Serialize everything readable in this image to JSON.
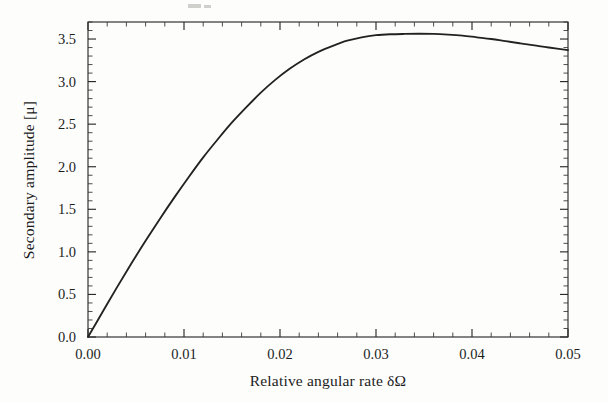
{
  "figure": {
    "background_color": "#fdfdfc",
    "curve_color": "#222222",
    "axis_color": "#2b2b2b"
  },
  "chart_data": {
    "type": "line",
    "title": "",
    "subtitle": "",
    "xlabel": "Relative angular rate  δΩ",
    "ylabel": "Secondary amplitude  [μ]",
    "xlim": [
      0.0,
      0.05
    ],
    "ylim": [
      0.0,
      3.7
    ],
    "grid": false,
    "legend": null,
    "legend_position": "none",
    "x_ticks": [
      0.0,
      0.01,
      0.02,
      0.03,
      0.04,
      0.05
    ],
    "x_tick_labels": [
      "0.00",
      "0.01",
      "0.02",
      "0.03",
      "0.04",
      "0.05"
    ],
    "x_minor_tick_count_per_interval": 5,
    "y_ticks": [
      0.0,
      0.5,
      1.0,
      1.5,
      2.0,
      2.5,
      3.0,
      3.5
    ],
    "y_tick_labels": [
      "0.0",
      "0.5",
      "1.0",
      "1.5",
      "2.0",
      "2.5",
      "3.0",
      "3.5"
    ],
    "y_minor_tick_count_per_interval": 5,
    "annotations": [],
    "series": [
      {
        "name": "Secondary amplitude",
        "color": "#222222",
        "x": [
          0.0,
          0.0015,
          0.003,
          0.0045,
          0.006,
          0.0075,
          0.009,
          0.0105,
          0.012,
          0.0135,
          0.015,
          0.0165,
          0.018,
          0.0195,
          0.021,
          0.0225,
          0.024,
          0.0255,
          0.027,
          0.0285,
          0.03,
          0.0315,
          0.033,
          0.0345,
          0.036,
          0.0375,
          0.039,
          0.0405,
          0.042,
          0.0435,
          0.045,
          0.0465,
          0.048,
          0.05
        ],
        "values": [
          0.0,
          0.29,
          0.58,
          0.86,
          1.13,
          1.39,
          1.64,
          1.88,
          2.11,
          2.32,
          2.52,
          2.7,
          2.87,
          3.02,
          3.15,
          3.26,
          3.35,
          3.42,
          3.48,
          3.52,
          3.545,
          3.556,
          3.56,
          3.562,
          3.56,
          3.552,
          3.54,
          3.52,
          3.5,
          3.475,
          3.45,
          3.425,
          3.4,
          3.37
        ]
      }
    ],
    "peak": {
      "x": 0.0355,
      "y": 3.56
    },
    "endpoint": {
      "x": 0.05,
      "y": 3.37
    },
    "origin_point": {
      "x": 0.0,
      "y": 0.0
    }
  }
}
